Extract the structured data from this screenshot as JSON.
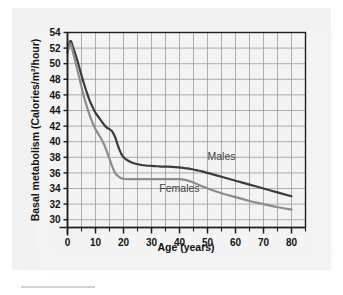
{
  "chart_data": {
    "type": "line",
    "title": "",
    "xlabel": "Age (years)",
    "ylabel": "Basal metabolism (Calories/m²/hour)",
    "xlim": [
      0,
      85
    ],
    "ylim": [
      29,
      54
    ],
    "xticks": [
      0,
      10,
      20,
      30,
      40,
      50,
      60,
      70,
      80
    ],
    "xtick_labels": [
      "0",
      "10",
      "20",
      "30",
      "40",
      "50",
      "60",
      "70",
      "80"
    ],
    "xminor_step": 5,
    "yticks": [
      30,
      32,
      34,
      36,
      38,
      40,
      42,
      44,
      46,
      48,
      50,
      52,
      54
    ],
    "ytick_labels": [
      "30",
      "32",
      "34",
      "36",
      "38",
      "40",
      "42",
      "44",
      "46",
      "48",
      "50",
      "52",
      "54"
    ],
    "grid": true,
    "grid_color": "#9a9a9a",
    "axis_color": "#1e1e1e",
    "legend_position": "inline-labels",
    "series": [
      {
        "name": "Males",
        "color": "#3c3c3c",
        "label_x": 55,
        "label_y": 37.6,
        "x": [
          0,
          1,
          2,
          3,
          4,
          5,
          6,
          7,
          8,
          9,
          10,
          11,
          12,
          13,
          14,
          15,
          16,
          17,
          18,
          19,
          20,
          22,
          24,
          26,
          28,
          30,
          32,
          34,
          36,
          38,
          40,
          42,
          44,
          46,
          48,
          50,
          55,
          60,
          65,
          70,
          75,
          80
        ],
        "y": [
          51.5,
          52.9,
          52.1,
          51.0,
          49.8,
          48.5,
          47.3,
          46.2,
          45.2,
          44.4,
          43.7,
          43.2,
          42.7,
          42.2,
          41.8,
          41.6,
          41.3,
          40.6,
          39.5,
          38.6,
          38.0,
          37.5,
          37.2,
          37.05,
          36.95,
          36.9,
          36.85,
          36.8,
          36.8,
          36.75,
          36.7,
          36.6,
          36.5,
          36.35,
          36.2,
          36.0,
          35.5,
          35.0,
          34.5,
          34.0,
          33.5,
          33.0
        ]
      },
      {
        "name": "Females",
        "color": "#8c8c8c",
        "label_x": 40,
        "label_y": 33.6,
        "x": [
          0,
          1,
          2,
          3,
          4,
          5,
          6,
          7,
          8,
          9,
          10,
          11,
          12,
          13,
          14,
          15,
          16,
          17,
          18,
          19,
          20,
          22,
          24,
          26,
          28,
          30,
          32,
          34,
          36,
          38,
          40,
          42,
          44,
          46,
          48,
          50,
          55,
          60,
          65,
          70,
          75,
          80
        ],
        "y": [
          51.3,
          52.6,
          51.4,
          50.0,
          48.5,
          47.0,
          45.6,
          44.4,
          43.3,
          42.4,
          41.6,
          41.0,
          40.4,
          39.7,
          38.8,
          37.8,
          36.8,
          36.0,
          35.6,
          35.35,
          35.25,
          35.2,
          35.2,
          35.2,
          35.2,
          35.2,
          35.2,
          35.2,
          35.2,
          35.2,
          35.2,
          35.1,
          34.9,
          34.6,
          34.3,
          34.0,
          33.4,
          32.9,
          32.4,
          32.0,
          31.6,
          31.3
        ]
      }
    ]
  },
  "figure": {
    "bottom_rule_present": true
  }
}
